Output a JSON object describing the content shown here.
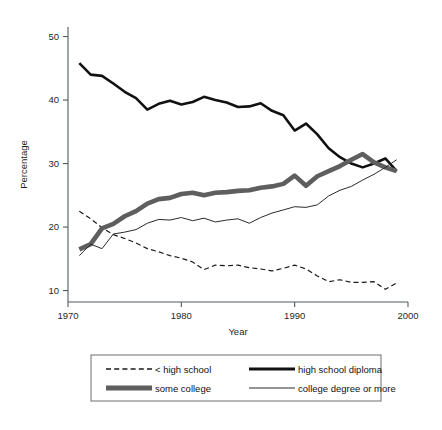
{
  "chart_data": {
    "type": "line",
    "title": "",
    "xlabel": "Year",
    "ylabel": "Percentage",
    "xlim": [
      1970,
      2000
    ],
    "ylim": [
      8.2,
      51.5
    ],
    "xticks": [
      1970,
      1980,
      1990,
      2000
    ],
    "xtick_labels": [
      "1970",
      "1980",
      "1990",
      "2000"
    ],
    "yticks": [
      10,
      20,
      30,
      40,
      50
    ],
    "ytick_labels": [
      "10",
      "20",
      "30",
      "40",
      "50"
    ],
    "grid": false,
    "legend_position": "bottom",
    "x": [
      1971,
      1972,
      1973,
      1974,
      1975,
      1976,
      1977,
      1978,
      1979,
      1980,
      1981,
      1982,
      1983,
      1984,
      1985,
      1986,
      1987,
      1988,
      1989,
      1990,
      1991,
      1992,
      1993,
      1994,
      1995,
      1996,
      1997,
      1998,
      1999
    ],
    "series": [
      {
        "name": "< high school",
        "style": "dashed",
        "color": "#1a1a1a",
        "width": 1.2,
        "values": [
          22.5,
          21.3,
          19.9,
          18.8,
          18.2,
          17.5,
          16.6,
          16.1,
          15.5,
          15.1,
          14.5,
          13.3,
          14.0,
          13.9,
          14.0,
          13.6,
          13.4,
          13.1,
          13.5,
          14.0,
          13.4,
          12.3,
          11.4,
          11.7,
          11.3,
          11.3,
          11.4,
          10.2,
          11.2
        ]
      },
      {
        "name": "high school diploma",
        "style": "solid",
        "color": "#111111",
        "width": 2.6,
        "values": [
          45.8,
          44.0,
          43.8,
          42.6,
          41.3,
          40.3,
          38.5,
          39.4,
          39.9,
          39.3,
          39.7,
          40.5,
          40.0,
          39.6,
          38.9,
          39.0,
          39.5,
          38.3,
          37.6,
          35.2,
          36.3,
          34.6,
          32.4,
          31.0,
          30.0,
          29.4,
          30.0,
          30.8,
          28.8
        ]
      },
      {
        "name": "some college",
        "style": "solid",
        "color": "#5e5e5e",
        "width": 4.6,
        "values": [
          16.5,
          17.3,
          19.8,
          20.5,
          21.7,
          22.5,
          23.7,
          24.4,
          24.6,
          25.2,
          25.4,
          25.0,
          25.4,
          25.5,
          25.7,
          25.8,
          26.2,
          26.4,
          26.8,
          28.1,
          26.5,
          28.0,
          28.8,
          29.6,
          30.6,
          31.5,
          30.2,
          29.4,
          28.8
        ]
      },
      {
        "name": "college degree or more",
        "style": "solid",
        "color": "#2b2b2b",
        "width": 1.0,
        "values": [
          15.5,
          17.3,
          16.6,
          18.9,
          19.2,
          19.6,
          20.6,
          21.2,
          21.1,
          21.5,
          21.0,
          21.4,
          20.8,
          21.1,
          21.3,
          20.6,
          21.5,
          22.2,
          22.7,
          23.2,
          23.1,
          23.5,
          24.9,
          25.8,
          26.4,
          27.4,
          28.3,
          29.4,
          30.6
        ]
      }
    ],
    "legend_entries": [
      {
        "label": "< high school",
        "style": "dashed",
        "color": "#1a1a1a",
        "width": 1.4
      },
      {
        "label": "high school diploma",
        "style": "solid",
        "color": "#111111",
        "width": 3.0
      },
      {
        "label": "some college",
        "style": "solid",
        "color": "#5e5e5e",
        "width": 5.0
      },
      {
        "label": "college degree or more",
        "style": "solid",
        "color": "#2b2b2b",
        "width": 1.0
      }
    ]
  }
}
